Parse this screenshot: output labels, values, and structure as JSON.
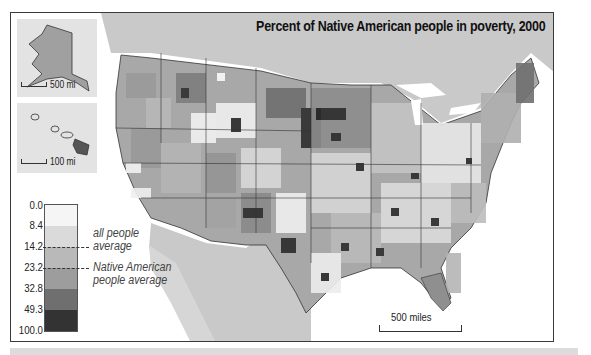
{
  "map": {
    "title": "Percent of Native American people in poverty, 2000",
    "subject": "Percent of Native American people in poverty by county, United States, 2000",
    "colors": {
      "ocean": "#ffffff",
      "neighbor_land": "#c9c9c9",
      "border": "#333333"
    }
  },
  "insets": {
    "alaska": {
      "scale_label": "500 mi"
    },
    "hawaii": {
      "scale_label": "100 mi"
    }
  },
  "legend": {
    "ticks": [
      "0.0",
      "8.4",
      "14.2",
      "23.2",
      "32.8",
      "49.3",
      "100.0"
    ],
    "classes": [
      {
        "range": "0.0–8.4",
        "color": "#f5f5f5"
      },
      {
        "range": "8.4–14.2",
        "color": "#dadada"
      },
      {
        "range": "14.2–23.2",
        "color": "#b9b9b9"
      },
      {
        "range": "23.2–32.8",
        "color": "#9d9d9d"
      },
      {
        "range": "32.8–49.3",
        "color": "#6f6f6f"
      },
      {
        "range": "49.3–100.0",
        "color": "#333333"
      }
    ],
    "markers": [
      {
        "value": "14.2",
        "label_line1": "all people",
        "label_line2": "average"
      },
      {
        "value": "23.2",
        "label_line1": "Native American",
        "label_line2": "people average"
      }
    ]
  },
  "scalebar": {
    "label": "500 miles"
  }
}
